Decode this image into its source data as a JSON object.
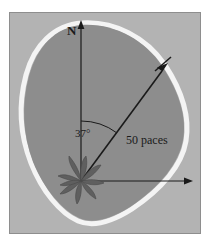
{
  "figure": {
    "kind": "treasure-map-diagram",
    "caption": "",
    "frame": {
      "background_color": "#b3b3b3",
      "border_color": "#8e8e8e"
    }
  },
  "island": {
    "name": "island-landmass",
    "fill_color": "#8f8f8f",
    "shoreline_color": "#f2f2f2",
    "shoreline_width": 4
  },
  "axes": {
    "color": "#1a1a1a",
    "vertical": {
      "name": "north-axis",
      "label": "N",
      "direction": "up"
    },
    "horizontal": {
      "name": "east-axis",
      "label": "",
      "direction": "right"
    },
    "origin_label": "palm-tree-origin"
  },
  "vector": {
    "name": "treasure-vector",
    "distance_label": "50 paces",
    "bearing_label": "37°",
    "bearing_degrees": 37,
    "start": "palm tree",
    "end": "X marks the spot",
    "color": "#1a1a1a"
  },
  "markers": {
    "start_marker": "palm-tree-icon",
    "end_marker": "x-marks-the-spot-icon",
    "marker_color": "#4d4d4d"
  },
  "arc": {
    "name": "bearing-arc",
    "color": "#1a1a1a"
  }
}
